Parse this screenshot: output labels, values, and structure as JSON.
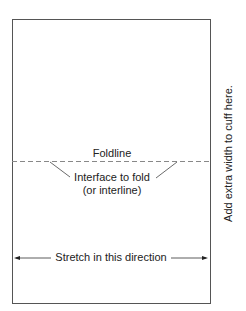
{
  "diagram": {
    "foldline_label": "Foldline",
    "interface_line1": "Interface to fold",
    "interface_line2": "(or interline)",
    "stretch_label": "Stretch in this direction",
    "side_note": "Add extra width to cuff here.",
    "colors": {
      "line": "#555555",
      "text": "#222222",
      "dash": "#888888"
    }
  }
}
